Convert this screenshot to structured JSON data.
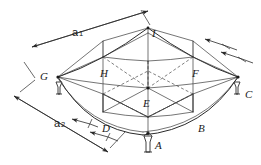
{
  "figure": {
    "stroke_color": "#2a2a2a",
    "background_color": "#ffffff"
  },
  "points": {
    "a": "A",
    "b": "B",
    "c": "C",
    "d": "D",
    "e": "E",
    "f": "F",
    "g": "G",
    "h": "H",
    "i": "I"
  },
  "dimensions": {
    "a1": {
      "base": "a",
      "sub": "1"
    },
    "a2": {
      "base": "a",
      "sub": "2"
    }
  },
  "icons": {
    "anchor_a": "anchor-icon",
    "anchor_c": "anchor-icon",
    "anchor_g": "anchor-icon",
    "arrow_a1_start": "arrow-icon",
    "arrow_a1_end": "arrow-icon",
    "arrow_a2_start": "arrow-icon",
    "arrow_a2_end": "arrow-icon",
    "arrow_right_upper": "arrow-icon",
    "arrow_right_lower": "arrow-icon",
    "arrow_d_upper": "arrow-icon",
    "arrow_d_lower": "arrow-icon"
  }
}
